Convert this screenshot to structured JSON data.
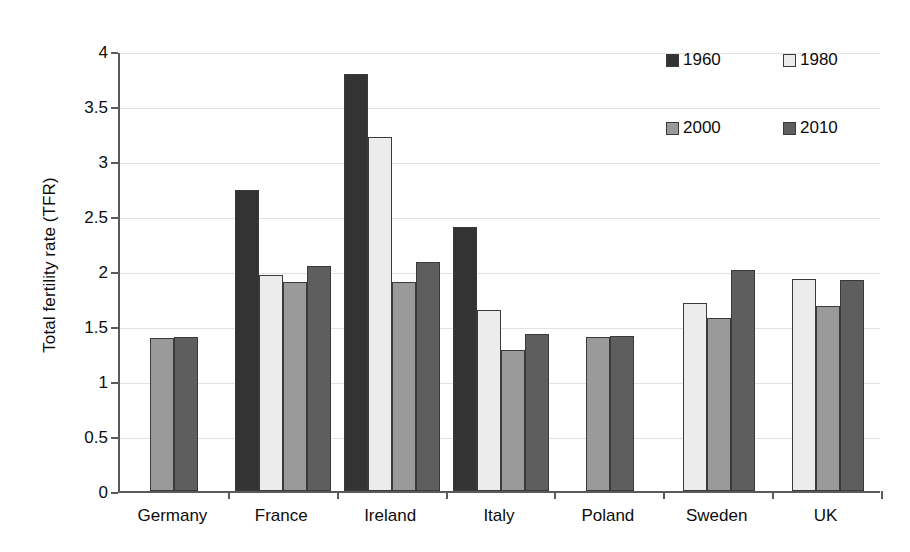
{
  "chart_data": {
    "type": "bar",
    "title": "",
    "xlabel": "",
    "ylabel": "Total fertility rate (TFR)",
    "ylim": [
      0,
      4
    ],
    "ytick_values": [
      0,
      0.5,
      1,
      1.5,
      2,
      2.5,
      3,
      3.5,
      4
    ],
    "ytick_labels": [
      "0",
      "0.5",
      "1",
      "1.5",
      "2",
      "2.5",
      "3",
      "3.5",
      "4"
    ],
    "grid": true,
    "legend_position": "top-right",
    "categories": [
      "Germany",
      "France",
      "Ireland",
      "Italy",
      "Poland",
      "Sweden",
      "UK"
    ],
    "series": [
      {
        "name": "1960",
        "color": "#333333",
        "values": [
          null,
          2.74,
          3.79,
          2.4,
          null,
          null,
          null
        ]
      },
      {
        "name": "1980",
        "color": "#ececec",
        "values": [
          null,
          1.96,
          3.22,
          1.65,
          null,
          1.71,
          1.93
        ]
      },
      {
        "name": "2000",
        "color": "#9a9a9a",
        "values": [
          1.39,
          1.9,
          1.9,
          1.28,
          1.4,
          1.57,
          1.68
        ]
      },
      {
        "name": "2010",
        "color": "#5e5e5e",
        "values": [
          1.4,
          2.05,
          2.08,
          1.43,
          1.41,
          2.01,
          1.92
        ]
      }
    ]
  },
  "legend": {
    "items": [
      {
        "label": "1960",
        "color": "#333333"
      },
      {
        "label": "1980",
        "color": "#ececec"
      },
      {
        "label": "2000",
        "color": "#9a9a9a"
      },
      {
        "label": "2010",
        "color": "#5e5e5e"
      }
    ]
  },
  "axes": {
    "y_title": "Total fertility rate (TFR)"
  }
}
